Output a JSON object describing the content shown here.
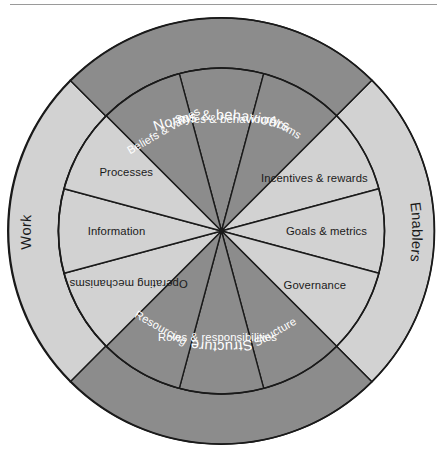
{
  "figure": {
    "name": "organisation-design-wheel",
    "shape": "twelve-segment-wheel-with-outer-ring",
    "background_color": "#ffffff"
  },
  "colors": {
    "dark_segment": "#8c8c8c",
    "light_segment": "#d2d2d2",
    "dark_ring": "#8c8c8c",
    "light_ring": "#d2d2d2",
    "outline": "#1a1a1a",
    "dark_text": "#ffffff",
    "light_text": "#1a1a1a",
    "rule": "#9a9a9a"
  },
  "outer_ring": {
    "labels": [
      {
        "id": "norms-and-behaviours",
        "text": "Norms & behaviours",
        "position": "top",
        "tone": "dark"
      },
      {
        "id": "enablers",
        "text": "Enablers",
        "position": "right",
        "tone": "light"
      },
      {
        "id": "structure",
        "text": "Structure",
        "position": "bottom",
        "tone": "dark"
      },
      {
        "id": "work",
        "text": "Work",
        "position": "left",
        "tone": "light"
      }
    ]
  },
  "segments": [
    {
      "index": 0,
      "id": "styles-and-behaviours",
      "text": "Styles & behaviours",
      "tone": "dark",
      "group": "norms-and-behaviours"
    },
    {
      "index": 1,
      "id": "norms",
      "text": "Norms",
      "tone": "dark",
      "group": "norms-and-behaviours"
    },
    {
      "index": 2,
      "id": "incentives-and-rewards",
      "text": "Incentives & rewards",
      "tone": "light",
      "group": "enablers"
    },
    {
      "index": 3,
      "id": "goals-and-metrics",
      "text": "Goals & metrics",
      "tone": "light",
      "group": "enablers"
    },
    {
      "index": 4,
      "id": "governance",
      "text": "Governance",
      "tone": "light",
      "group": "enablers"
    },
    {
      "index": 5,
      "id": "structure",
      "text": "Structure",
      "tone": "dark",
      "group": "structure"
    },
    {
      "index": 6,
      "id": "roles-and-responsibilities",
      "text": "Roles & responsibilities",
      "tone": "dark",
      "group": "structure"
    },
    {
      "index": 7,
      "id": "resourcing",
      "text": "Resourcing",
      "tone": "dark",
      "group": "structure"
    },
    {
      "index": 8,
      "id": "operating-mechanisms",
      "text": "Operating mechanisms",
      "tone": "light",
      "group": "work"
    },
    {
      "index": 9,
      "id": "information",
      "text": "Information",
      "tone": "light",
      "group": "work"
    },
    {
      "index": 10,
      "id": "processes",
      "text": "Processes",
      "tone": "light",
      "group": "work"
    },
    {
      "index": 11,
      "id": "beliefs-and-values",
      "text": "Beliefs & values",
      "tone": "dark",
      "group": "norms-and-behaviours"
    }
  ]
}
